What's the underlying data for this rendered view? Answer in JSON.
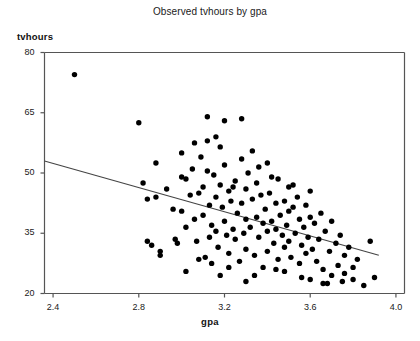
{
  "chart_data": {
    "type": "scatter",
    "title": "Observed tvhours by gpa",
    "xlabel": "gpa",
    "ylabel": "tvhours",
    "xlim": [
      2.36,
      4.04
    ],
    "ylim": [
      20,
      80
    ],
    "xticks": [
      2.4,
      2.8,
      3.2,
      3.6,
      4.0
    ],
    "xtick_labels": [
      "2.4",
      "2.8",
      "3.2",
      "3.6",
      "4.0"
    ],
    "yticks": [
      20,
      35,
      50,
      65,
      80
    ],
    "ytick_labels": [
      "20",
      "35",
      "50",
      "65",
      "80"
    ],
    "grid": false,
    "legend": "none",
    "marker": {
      "shape": "circle",
      "color": "#000000",
      "size": 4.4
    },
    "fit_line": {
      "label": "linear fit",
      "color": "#444444",
      "x_start": 2.36,
      "y_start": 53.0,
      "x_end": 3.92,
      "y_end": 29.5
    },
    "points": [
      [
        2.5,
        74.5
      ],
      [
        2.8,
        62.5
      ],
      [
        2.82,
        47.5
      ],
      [
        2.84,
        43.5
      ],
      [
        2.84,
        33.0
      ],
      [
        2.86,
        32.0
      ],
      [
        2.88,
        44.0
      ],
      [
        2.9,
        30.5
      ],
      [
        2.9,
        29.5
      ],
      [
        2.93,
        46.0
      ],
      [
        2.96,
        41.0
      ],
      [
        2.97,
        33.5
      ],
      [
        2.98,
        32.5
      ],
      [
        3.0,
        55.0
      ],
      [
        3.0,
        49.0
      ],
      [
        3.0,
        40.5
      ],
      [
        3.02,
        48.5
      ],
      [
        3.02,
        36.5
      ],
      [
        3.04,
        44.5
      ],
      [
        3.05,
        51.0
      ],
      [
        3.06,
        38.5
      ],
      [
        3.07,
        33.0
      ],
      [
        3.08,
        28.5
      ],
      [
        3.09,
        54.0
      ],
      [
        3.1,
        46.5
      ],
      [
        3.1,
        39.5
      ],
      [
        3.11,
        29.0
      ],
      [
        3.12,
        58.0
      ],
      [
        3.12,
        50.5
      ],
      [
        3.13,
        42.0
      ],
      [
        3.14,
        37.0
      ],
      [
        3.14,
        27.5
      ],
      [
        3.15,
        49.5
      ],
      [
        3.16,
        44.0
      ],
      [
        3.16,
        35.5
      ],
      [
        3.17,
        31.5
      ],
      [
        3.18,
        56.5
      ],
      [
        3.18,
        47.0
      ],
      [
        3.19,
        41.5
      ],
      [
        3.2,
        63.0
      ],
      [
        3.2,
        52.0
      ],
      [
        3.2,
        38.0
      ],
      [
        3.21,
        34.5
      ],
      [
        3.22,
        45.5
      ],
      [
        3.22,
        30.0
      ],
      [
        3.23,
        43.0
      ],
      [
        3.24,
        36.0
      ],
      [
        3.25,
        48.0
      ],
      [
        3.25,
        33.5
      ],
      [
        3.26,
        40.0
      ],
      [
        3.27,
        28.0
      ],
      [
        3.28,
        53.5
      ],
      [
        3.28,
        42.5
      ],
      [
        3.29,
        35.0
      ],
      [
        3.3,
        46.0
      ],
      [
        3.3,
        38.5
      ],
      [
        3.3,
        31.0
      ],
      [
        3.31,
        50.0
      ],
      [
        3.32,
        36.5
      ],
      [
        3.33,
        43.5
      ],
      [
        3.34,
        29.5
      ],
      [
        3.35,
        47.5
      ],
      [
        3.35,
        39.0
      ],
      [
        3.36,
        34.0
      ],
      [
        3.37,
        44.5
      ],
      [
        3.38,
        37.5
      ],
      [
        3.38,
        26.5
      ],
      [
        3.39,
        41.0
      ],
      [
        3.4,
        52.5
      ],
      [
        3.4,
        35.5
      ],
      [
        3.4,
        30.5
      ],
      [
        3.41,
        45.0
      ],
      [
        3.42,
        38.0
      ],
      [
        3.43,
        32.5
      ],
      [
        3.44,
        42.5
      ],
      [
        3.44,
        36.0
      ],
      [
        3.45,
        48.5
      ],
      [
        3.45,
        28.5
      ],
      [
        3.46,
        39.5
      ],
      [
        3.47,
        34.5
      ],
      [
        3.48,
        43.0
      ],
      [
        3.48,
        31.5
      ],
      [
        3.49,
        37.0
      ],
      [
        3.5,
        46.5
      ],
      [
        3.5,
        40.5
      ],
      [
        3.5,
        33.0
      ],
      [
        3.51,
        29.0
      ],
      [
        3.52,
        41.5
      ],
      [
        3.53,
        35.0
      ],
      [
        3.54,
        44.0
      ],
      [
        3.55,
        38.5
      ],
      [
        3.55,
        27.5
      ],
      [
        3.56,
        32.0
      ],
      [
        3.57,
        36.5
      ],
      [
        3.58,
        42.0
      ],
      [
        3.58,
        30.0
      ],
      [
        3.59,
        34.0
      ],
      [
        3.6,
        45.5
      ],
      [
        3.6,
        39.0
      ],
      [
        3.6,
        23.5
      ],
      [
        3.61,
        31.0
      ],
      [
        3.62,
        37.5
      ],
      [
        3.63,
        28.0
      ],
      [
        3.64,
        33.5
      ],
      [
        3.65,
        40.0
      ],
      [
        3.66,
        26.0
      ],
      [
        3.66,
        22.5
      ],
      [
        3.67,
        35.5
      ],
      [
        3.68,
        22.5
      ],
      [
        3.69,
        30.5
      ],
      [
        3.7,
        38.0
      ],
      [
        3.7,
        24.5
      ],
      [
        3.72,
        32.5
      ],
      [
        3.73,
        27.0
      ],
      [
        3.74,
        34.5
      ],
      [
        3.75,
        23.0
      ],
      [
        3.76,
        29.5
      ],
      [
        3.76,
        25.0
      ],
      [
        3.78,
        31.5
      ],
      [
        3.8,
        26.5
      ],
      [
        3.8,
        23.5
      ],
      [
        3.82,
        28.5
      ],
      [
        3.85,
        22.0
      ],
      [
        3.88,
        33.0
      ],
      [
        3.9,
        24.0
      ],
      [
        3.12,
        64.0
      ],
      [
        3.28,
        63.5
      ],
      [
        2.88,
        52.5
      ],
      [
        3.06,
        57.5
      ],
      [
        3.33,
        55.5
      ],
      [
        3.42,
        49.0
      ],
      [
        3.52,
        47.0
      ],
      [
        3.16,
        59.0
      ],
      [
        3.36,
        51.5
      ],
      [
        3.08,
        45.0
      ],
      [
        3.44,
        26.0
      ],
      [
        3.22,
        26.5
      ],
      [
        3.02,
        25.5
      ],
      [
        3.18,
        24.5
      ],
      [
        3.56,
        24.0
      ],
      [
        3.34,
        24.5
      ],
      [
        3.48,
        25.5
      ],
      [
        3.3,
        23.0
      ],
      [
        3.13,
        34.0
      ],
      [
        3.24,
        46.5
      ]
    ]
  }
}
